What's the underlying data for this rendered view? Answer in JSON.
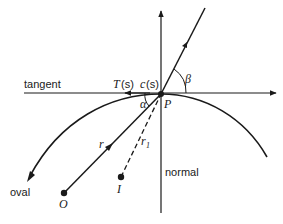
{
  "diagram": {
    "labels": {
      "tangent": "tangent",
      "normal": "normal",
      "oval": "oval",
      "T": "T",
      "T_arg": "(s)",
      "c": "c",
      "c_arg": "(s)",
      "beta": "β",
      "alpha": "α",
      "P": "P",
      "r": "r",
      "r1": "r",
      "r1_sub": "1",
      "O": "O",
      "I": "I"
    },
    "points": {
      "P": [
        161,
        94
      ],
      "O": [
        64,
        193
      ],
      "I": [
        121,
        177
      ]
    },
    "colors": {
      "stroke": "#1a1a1a",
      "background": "#ffffff"
    }
  }
}
